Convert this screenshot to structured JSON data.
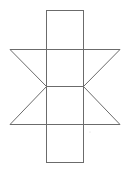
{
  "diagram": {
    "type": "prism-net",
    "stroke_color": "#6b6b6b",
    "background_color": "#ffffff",
    "rectangle_strip": {
      "x1": 46,
      "x2": 83,
      "y_top": 10,
      "y_bottom": 162
    },
    "fold_lines_y": [
      49,
      86,
      124
    ],
    "wing_extent": {
      "left_x": 10,
      "right_x": 120
    },
    "triangles": [
      {
        "name": "upper-left",
        "points": [
          [
            10,
            49
          ],
          [
            46,
            49
          ],
          [
            46,
            86
          ]
        ]
      },
      {
        "name": "upper-right",
        "points": [
          [
            83,
            49
          ],
          [
            120,
            49
          ],
          [
            83,
            86
          ]
        ]
      },
      {
        "name": "lower-left",
        "points": [
          [
            46,
            86
          ],
          [
            46,
            124
          ],
          [
            10,
            124
          ]
        ]
      },
      {
        "name": "lower-right",
        "points": [
          [
            83,
            86
          ],
          [
            120,
            124
          ],
          [
            83,
            124
          ]
        ]
      }
    ]
  }
}
